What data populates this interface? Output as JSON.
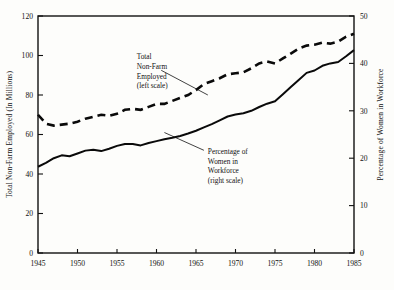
{
  "chart_data": {
    "type": "line",
    "title": "",
    "xlabel": "",
    "ylabel": "Total Non-Farm Employed (In Millions)",
    "y2label": "Percentage of Women in Workforce",
    "xlim": [
      1945,
      1985
    ],
    "ylim": [
      0,
      120
    ],
    "y2lim": [
      0,
      50
    ],
    "grid": false,
    "legend_position": "inline-annotations",
    "xticks": [
      1945,
      1950,
      1955,
      1960,
      1965,
      1970,
      1975,
      1980,
      1985
    ],
    "xtick_labels": [
      "1945",
      "1950",
      "1955",
      "1960",
      "1965",
      "1970",
      "1975",
      "1980",
      "1985"
    ],
    "yticks": [
      0,
      20,
      40,
      60,
      80,
      100,
      120
    ],
    "ytick_labels": [
      "0",
      "20",
      "40",
      "60",
      "80",
      "100",
      "120"
    ],
    "y2ticks": [
      0,
      10,
      20,
      30,
      40,
      50
    ],
    "y2tick_labels": [
      "0",
      "10",
      "20",
      "30",
      "40",
      "50"
    ],
    "annotations": [
      {
        "id": "total-nonfarm",
        "lines": [
          "Total",
          "Non-Farm",
          "Employed",
          "(left scale)"
        ],
        "x": 1957.5,
        "y": 98
      },
      {
        "id": "pct-women",
        "lines": [
          "Percentage of",
          "Women in",
          "Workforce",
          "(right scale)"
        ],
        "x": 1966.5,
        "y": 50
      }
    ],
    "x": [
      1945,
      1946,
      1947,
      1948,
      1949,
      1950,
      1951,
      1952,
      1953,
      1954,
      1955,
      1956,
      1957,
      1958,
      1959,
      1960,
      1961,
      1962,
      1963,
      1964,
      1965,
      1966,
      1967,
      1968,
      1969,
      1970,
      1971,
      1972,
      1973,
      1974,
      1975,
      1976,
      1977,
      1978,
      1979,
      1980,
      1981,
      1982,
      1983,
      1984,
      1985
    ],
    "series": [
      {
        "name": "Total Non-Farm Employed (left scale)",
        "axis": "left",
        "style": "dashed",
        "units": "millions",
        "values": [
          70.0,
          65.5,
          64.5,
          65.0,
          65.5,
          66.5,
          68.0,
          69.0,
          70.0,
          69.5,
          70.5,
          72.5,
          73.0,
          72.5,
          74.0,
          75.5,
          75.5,
          77.0,
          78.5,
          80.0,
          82.5,
          85.5,
          87.0,
          88.5,
          90.5,
          91.0,
          91.5,
          93.5,
          96.0,
          97.0,
          96.0,
          98.5,
          101.0,
          103.5,
          105.0,
          105.5,
          106.5,
          106.0,
          107.0,
          109.5,
          111.0
        ]
      },
      {
        "name": "Percentage of Women in Workforce (right scale)",
        "axis": "right",
        "style": "solid",
        "units": "percent",
        "values": [
          18.2,
          19.0,
          20.0,
          20.6,
          20.4,
          21.0,
          21.6,
          21.8,
          21.5,
          22.0,
          22.6,
          23.0,
          23.0,
          22.7,
          23.2,
          23.6,
          24.0,
          24.3,
          24.7,
          25.2,
          25.8,
          26.5,
          27.2,
          28.0,
          28.8,
          29.2,
          29.5,
          30.0,
          30.8,
          31.5,
          32.0,
          33.5,
          35.0,
          36.5,
          38.0,
          38.5,
          39.5,
          40.0,
          40.3,
          41.5,
          42.8
        ]
      }
    ]
  },
  "figure": {
    "plot_left_px": 38,
    "plot_right_px": 354,
    "plot_top_px": 16,
    "plot_bottom_px": 253
  }
}
